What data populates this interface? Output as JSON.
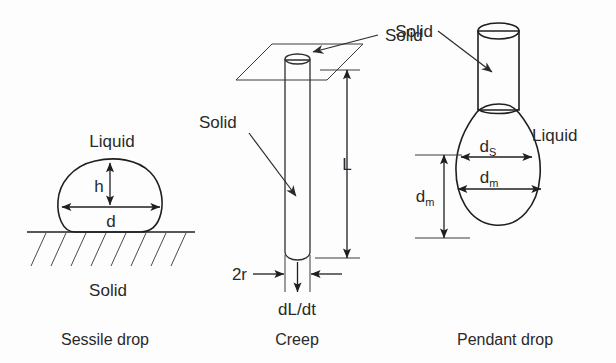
{
  "figure": {
    "background_color": "#fdfdfd",
    "ink_color": "#1f1f1f"
  },
  "panels": [
    {
      "id": "sessile",
      "caption": "Sessile drop",
      "labels": {
        "liquid": "Liquid",
        "solid": "Solid",
        "height_dim": "h",
        "diameter_dim": "d"
      }
    },
    {
      "id": "creep",
      "caption": "Creep",
      "labels": {
        "solid_plate": "Solid",
        "solid_rod": "Solid",
        "length_dim": "L",
        "radius_dim": "2r",
        "rate_dim": "dL/dt"
      }
    },
    {
      "id": "pendant",
      "caption": "Pendant drop",
      "labels": {
        "solid": "Solid",
        "liquid": "Liquid",
        "ds_base": "d",
        "ds_sub": "S",
        "dm_base": "d",
        "dm_sub": "m",
        "dm_vert_base": "d",
        "dm_vert_sub": "m"
      }
    }
  ]
}
